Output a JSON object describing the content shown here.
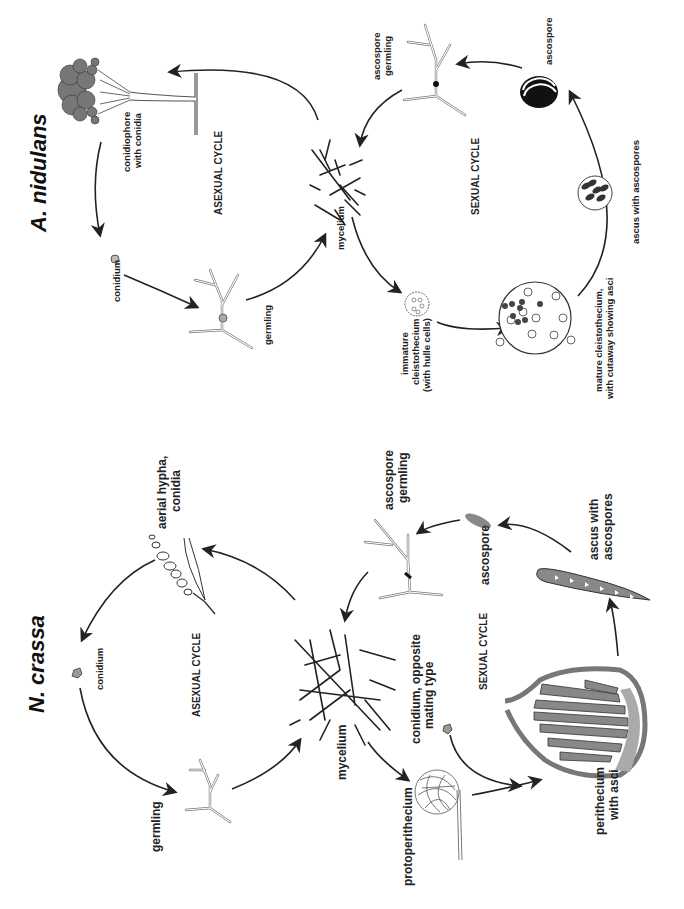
{
  "figure": {
    "orientation": "rotated 90deg clockwise (text reads bottom-to-top)",
    "panels": [
      {
        "id": "a_nidulans",
        "title": "A. nidulans",
        "asexual_cycle": {
          "label": "ASEXUAL CYCLE",
          "stages": [
            "conidiophore with conidia",
            "conidium",
            "germling",
            "mycelium"
          ]
        },
        "sexual_cycle": {
          "label": "SEXUAL CYCLE",
          "stages": [
            "immature cleistothecium (with hulle cells)",
            "mature cleistothecium, with cutaway showing asci",
            "ascus with ascospores",
            "ascospore",
            "ascospore germling"
          ]
        },
        "labels": {
          "conidiophore_1": "conidiophore",
          "conidiophore_2": "with conidia",
          "conidium": "conidium",
          "germling": "germling",
          "mycelium": "mycelium",
          "immature_1": "immature",
          "immature_2": "cleistothecium",
          "immature_3": "(with hulle cells)",
          "mature_1": "mature cleistothecium,",
          "mature_2": "with cutaway showing asci",
          "ascus": "ascus with ascospores",
          "ascospore": "ascospore",
          "asg_1": "ascospore",
          "asg_2": "germling"
        }
      },
      {
        "id": "n_crassa",
        "title": "N. crassa",
        "asexual_cycle": {
          "label": "ASEXUAL CYCLE",
          "stages": [
            "aerial hypha, conidia",
            "conidium",
            "germling",
            "mycelium"
          ]
        },
        "sexual_cycle": {
          "label": "SEXUAL CYCLE",
          "stages": [
            "protoperithecium",
            "conidium, opposite mating type",
            "perithecium with asci",
            "ascus with ascospores",
            "ascospore",
            "ascospore germling"
          ]
        },
        "labels": {
          "aerial_1": "aerial hypha,",
          "aerial_2": "conidia",
          "conidium": "conidium",
          "germling": "germling",
          "mycelium": "mycelium",
          "proto": "protoperithecium",
          "opp_1": "conidium, opposite",
          "opp_2": "mating type",
          "peri_1": "perithecium",
          "peri_2": "with asci",
          "ascus_1": "ascus with",
          "ascus_2": "ascospores",
          "ascospore": "ascospore",
          "asg_1": "ascospore",
          "asg_2": "germling"
        }
      }
    ],
    "colors": {
      "ink": "#222222",
      "gray_fill": "#8a8a8a",
      "light_gray": "#bdbdbd",
      "background": "#ffffff"
    }
  }
}
